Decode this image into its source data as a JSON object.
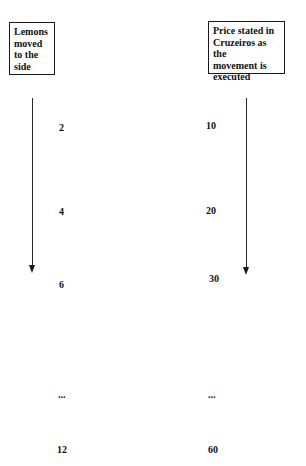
{
  "diagram": {
    "columns": [
      {
        "header": "Lemons moved to the side",
        "header_lines": [
          "Lemons",
          "moved",
          "to the",
          "side"
        ],
        "values": [
          "2",
          "4",
          "6",
          "...",
          "12"
        ]
      },
      {
        "header": "Price stated in Cruzeiros as the movement is executed",
        "header_lines": [
          "Price stated in",
          "Cruzeiros as the",
          "movement is",
          "executed"
        ],
        "values": [
          "10",
          "20",
          "30",
          "...",
          "60"
        ]
      }
    ],
    "arrows": [
      {
        "column": 0,
        "direction": "down"
      },
      {
        "column": 1,
        "direction": "down"
      }
    ],
    "colors": {
      "background": "#ffffff",
      "ink": "#111111"
    }
  }
}
